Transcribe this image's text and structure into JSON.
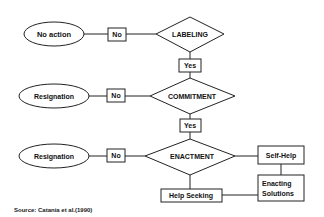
{
  "diagram": {
    "rows": [
      {
        "outcome": "No action",
        "branch_label": "No",
        "decision": "LABELING",
        "continue_label": "Yes"
      },
      {
        "outcome": "Resignation",
        "branch_label": "No",
        "decision": "COMMITMENT",
        "continue_label": "Yes"
      },
      {
        "outcome": "Resignation",
        "branch_label": "No",
        "decision": "ENACTMENT"
      }
    ],
    "actions": {
      "self_help": "Self-Help",
      "enacting_line1": "Enacting",
      "enacting_line2": "Solutions",
      "help_seeking": "Help Seeking"
    },
    "source": "Source: Catania et al.(1990)",
    "colors": {
      "stroke": "#222222",
      "background": "#ffffff",
      "text": "#111111"
    }
  }
}
